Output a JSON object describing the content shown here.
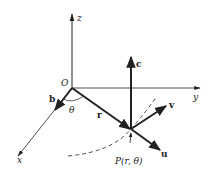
{
  "diagram": {
    "type": "3d-coordinate-vector-diagram",
    "axes": {
      "x_label": "x",
      "y_label": "y",
      "z_label": "z",
      "origin_label": "O"
    },
    "vectors": {
      "b_label": "b",
      "r_label": "r",
      "c_label": "c",
      "u_label": "u",
      "v_label": "v"
    },
    "angle_label": "θ",
    "point_label": "P(r, θ)",
    "colors": {
      "ink": "#222222",
      "background": "#ffffff"
    }
  }
}
